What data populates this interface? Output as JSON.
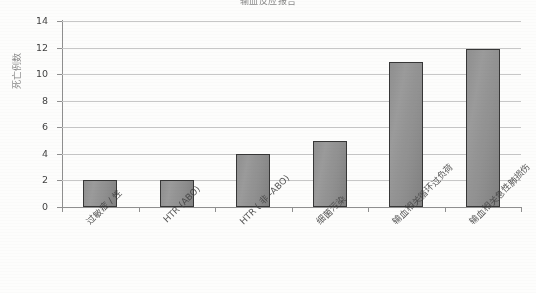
{
  "chart_data": {
    "type": "bar",
    "title": "输血反应报告",
    "xlabel": "",
    "ylabel": "死亡例数",
    "ylim": [
      0,
      14
    ],
    "yticks": [
      0,
      2,
      4,
      6,
      8,
      10,
      12,
      14
    ],
    "grid": true,
    "legend": "none",
    "categories": [
      "过敏症 / 性",
      "HTR (ABO)",
      "HTR ( 非 -ABO)",
      "细菌污染",
      "输血相关循环过负荷",
      "输血相关急性肺损伤"
    ],
    "values": [
      2,
      2,
      4,
      5,
      10.9,
      11.9
    ],
    "bar_color": "#8e8e8e",
    "bar_border_color": "#2f2f2f",
    "grid_color": "#c9c9c9",
    "axis_color": "#8d8d8d"
  }
}
